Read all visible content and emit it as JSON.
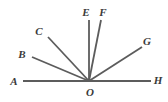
{
  "figure": {
    "type": "geometry-diagram",
    "width": 168,
    "height": 102,
    "background_color": "#ffffff",
    "stroke_color": "#5c5c5c",
    "label_color": "#3a3a3a",
    "stroke_width": 1.8,
    "baseline_stroke_width": 2.2,
    "vertex": {
      "name": "O",
      "x": 89,
      "y": 81
    },
    "baseline": {
      "name": "line-AH",
      "x1": 23,
      "y1": 81,
      "x2": 151,
      "y2": 81
    },
    "rays": [
      {
        "name": "ray-OB",
        "label": "B",
        "x1": 89,
        "y1": 81,
        "x2": 32,
        "y2": 57
      },
      {
        "name": "ray-OC",
        "label": "C",
        "x1": 89,
        "y1": 81,
        "x2": 48,
        "y2": 37
      },
      {
        "name": "ray-OE",
        "label": "E",
        "x1": 89,
        "y1": 81,
        "x2": 89,
        "y2": 20
      },
      {
        "name": "ray-OF",
        "label": "F",
        "x1": 89,
        "y1": 81,
        "x2": 101,
        "y2": 20
      },
      {
        "name": "ray-OG",
        "label": "G",
        "x1": 89,
        "y1": 81,
        "x2": 142,
        "y2": 47
      }
    ],
    "labels": [
      {
        "name": "label-A",
        "text": "A",
        "x": 14,
        "y": 81
      },
      {
        "name": "label-B",
        "text": "B",
        "x": 22,
        "y": 54
      },
      {
        "name": "label-C",
        "text": "C",
        "x": 39,
        "y": 31
      },
      {
        "name": "label-E",
        "text": "E",
        "x": 86,
        "y": 12
      },
      {
        "name": "label-F",
        "text": "F",
        "x": 103,
        "y": 12
      },
      {
        "name": "label-G",
        "text": "G",
        "x": 147,
        "y": 41
      },
      {
        "name": "label-H",
        "text": "H",
        "x": 158,
        "y": 80
      },
      {
        "name": "label-O",
        "text": "O",
        "x": 90,
        "y": 92
      }
    ]
  }
}
